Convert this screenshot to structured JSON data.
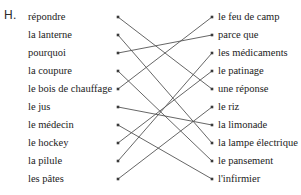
{
  "worksheet": {
    "exercise_label": "H.",
    "top_partial_text": "",
    "line_color": "#555555",
    "text_color": "#222222",
    "background": "#ffffff"
  },
  "left_column": [
    {
      "id": "l1",
      "label": "répondre"
    },
    {
      "id": "l2",
      "label": "la lanterne"
    },
    {
      "id": "l3",
      "label": "pourquoi"
    },
    {
      "id": "l4",
      "label": "la coupure"
    },
    {
      "id": "l5",
      "label": "le bois de chauffage"
    },
    {
      "id": "l6",
      "label": "le jus"
    },
    {
      "id": "l7",
      "label": "le médecin"
    },
    {
      "id": "l8",
      "label": "le hockey"
    },
    {
      "id": "l9",
      "label": "la pilule"
    },
    {
      "id": "l10",
      "label": "les pâtes"
    }
  ],
  "right_column": [
    {
      "id": "r1",
      "label": "le feu de camp"
    },
    {
      "id": "r2",
      "label": "parce que"
    },
    {
      "id": "r3",
      "label": "les médicaments"
    },
    {
      "id": "r4",
      "label": "le patinage"
    },
    {
      "id": "r5",
      "label": "une réponse"
    },
    {
      "id": "r6",
      "label": "le riz"
    },
    {
      "id": "r7",
      "label": "la limonade"
    },
    {
      "id": "r8",
      "label": "la lampe électrique"
    },
    {
      "id": "r9",
      "label": "le pansement"
    },
    {
      "id": "r10",
      "label": "l'infirmier"
    }
  ],
  "connections": [
    {
      "from": 1,
      "to": 5
    },
    {
      "from": 2,
      "to": 8
    },
    {
      "from": 3,
      "to": 2
    },
    {
      "from": 4,
      "to": 9
    },
    {
      "from": 5,
      "to": 1
    },
    {
      "from": 6,
      "to": 7
    },
    {
      "from": 7,
      "to": 10
    },
    {
      "from": 8,
      "to": 4
    },
    {
      "from": 9,
      "to": 3
    },
    {
      "from": 10,
      "to": 6
    }
  ],
  "geometry": {
    "left_dot_x": 118,
    "right_dot_x": 212,
    "first_row_y": 17,
    "row_spacing": 18
  }
}
